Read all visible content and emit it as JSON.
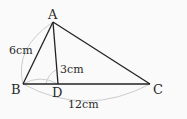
{
  "diagram": {
    "points": {
      "A": {
        "label": "A",
        "x": 53,
        "y": 22
      },
      "B": {
        "label": "B",
        "x": 23,
        "y": 84
      },
      "C": {
        "label": "C",
        "x": 150,
        "y": 84
      },
      "D": {
        "label": "D",
        "x": 58,
        "y": 84
      }
    },
    "measures": {
      "AB": "6cm",
      "AD": "3cm",
      "BC": "12cm"
    },
    "colors": {
      "line": "#222222",
      "arc": "#cccccc",
      "background": "#fafafa"
    }
  }
}
